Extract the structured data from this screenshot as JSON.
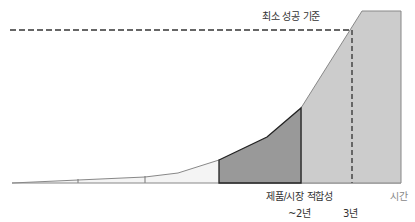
{
  "diagram": {
    "threshold_label": "최소 성공 기준",
    "pmf_label": "제품/시장 적합성",
    "axis_label": "시간",
    "tick_2y": "~2년",
    "tick_3y": "3년"
  },
  "colors": {
    "line": "#777777",
    "pale_fill": "#f2f2f2",
    "dark_fill": "#999999",
    "light_fill": "#cccccc",
    "dash": "#666666",
    "outline": "#222222"
  }
}
